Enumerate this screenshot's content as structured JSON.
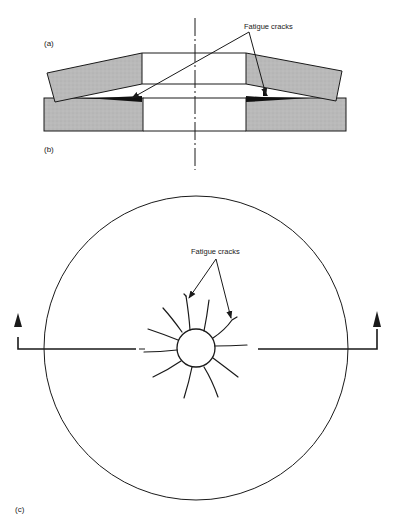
{
  "figure": {
    "panels": [
      {
        "id": "a",
        "label": "(a)",
        "description": "Cross-section of upper coned plate/washer tilted on lower plate"
      },
      {
        "id": "b",
        "label": "(b)",
        "description": "Cross-section of lower flat plate with central bore"
      },
      {
        "id": "c",
        "label": "(c)",
        "description": "Plan view of disc with central hole showing radial fatigue cracks and section line"
      }
    ],
    "annotations": {
      "top_callout": "Fatigue cracks",
      "bottom_callout": "Fatigue cracks"
    },
    "colors": {
      "stroke": "#1a1a1a",
      "section_fill": "#b8b8b8",
      "crack_fill": "#111111",
      "background": "#ffffff"
    },
    "plan_view": {
      "outer_circle": {
        "cx": 196,
        "cy": 348,
        "r": 151
      },
      "inner_hole": {
        "cx": 196,
        "cy": 348,
        "r": 19
      },
      "radial_crack_count": 12
    }
  }
}
